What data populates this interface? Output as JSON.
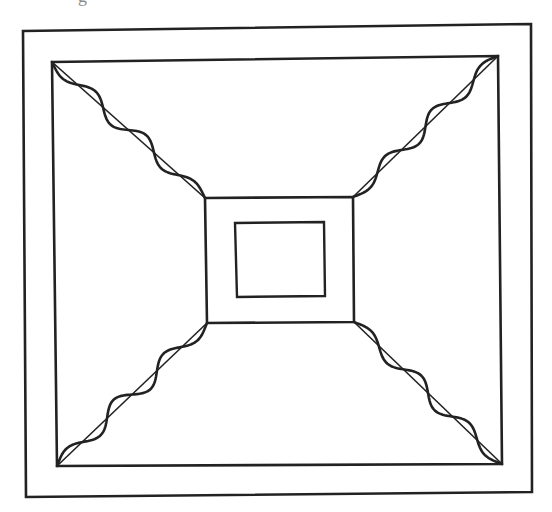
{
  "figure": {
    "cropped_caption_fragment": "g",
    "ink_color": "#222222",
    "background_color": "#ffffff",
    "elements": {
      "outer_border": "outer-border-frame",
      "inner_square": "inner-square-frame",
      "central_square": "central-square",
      "innermost_square": "innermost-square",
      "diagonals": [
        {
          "id": "top-left",
          "wave_cycles": 3
        },
        {
          "id": "top-right",
          "wave_cycles": 3
        },
        {
          "id": "bottom-left",
          "wave_cycles": 3
        },
        {
          "id": "bottom-right",
          "wave_cycles": 3
        }
      ]
    }
  }
}
